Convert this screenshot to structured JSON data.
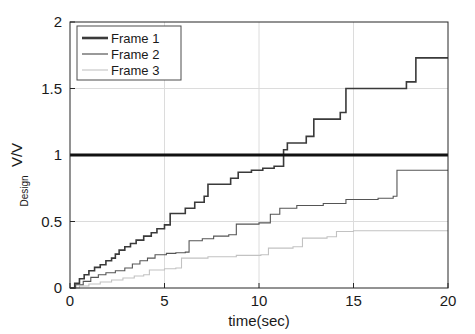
{
  "chart_data": {
    "type": "line",
    "title": "",
    "xlabel": "time(sec)",
    "ylabel": "V/V",
    "ylabel_subscript": "Design",
    "xlim": [
      0,
      20
    ],
    "ylim": [
      0,
      2
    ],
    "xticks": [
      0,
      5,
      10,
      15,
      20
    ],
    "xticklabels": [
      "0",
      "5",
      "10",
      "15",
      "20"
    ],
    "yticks": [
      0,
      0.5,
      1,
      1.5,
      2
    ],
    "yticklabels": [
      "0",
      "0.5",
      "1",
      "1.5",
      "2"
    ],
    "grid": true,
    "legend_position": "upper-left",
    "drawstyle": "steps-post",
    "series": [
      {
        "name": "Frame 1",
        "color": "#3a3a3a",
        "width": 1.6,
        "points": [
          [
            0.0,
            0.0
          ],
          [
            0.25,
            0.035
          ],
          [
            0.5,
            0.07
          ],
          [
            0.75,
            0.1
          ],
          [
            1.0,
            0.13
          ],
          [
            1.3,
            0.155
          ],
          [
            1.6,
            0.175
          ],
          [
            1.9,
            0.205
          ],
          [
            2.2,
            0.225
          ],
          [
            2.4,
            0.255
          ],
          [
            2.6,
            0.285
          ],
          [
            2.9,
            0.31
          ],
          [
            3.2,
            0.335
          ],
          [
            3.5,
            0.36
          ],
          [
            3.9,
            0.39
          ],
          [
            4.3,
            0.415
          ],
          [
            4.6,
            0.445
          ],
          [
            5.0,
            0.475
          ],
          [
            5.3,
            0.56
          ],
          [
            6.1,
            0.6
          ],
          [
            6.6,
            0.645
          ],
          [
            7.1,
            0.69
          ],
          [
            7.3,
            0.78
          ],
          [
            8.5,
            0.825
          ],
          [
            8.9,
            0.87
          ],
          [
            9.6,
            0.885
          ],
          [
            10.2,
            0.9
          ],
          [
            10.8,
            0.915
          ],
          [
            11.3,
            1.04
          ],
          [
            11.5,
            1.09
          ],
          [
            12.5,
            1.14
          ],
          [
            12.9,
            1.27
          ],
          [
            14.3,
            1.32
          ],
          [
            14.6,
            1.5
          ],
          [
            17.8,
            1.55
          ],
          [
            18.3,
            1.73
          ],
          [
            20.0,
            1.73
          ]
        ]
      },
      {
        "name": "Frame 2",
        "color": "#555555",
        "width": 1.1,
        "points": [
          [
            0.0,
            0.0
          ],
          [
            0.3,
            0.025
          ],
          [
            0.7,
            0.05
          ],
          [
            1.1,
            0.08
          ],
          [
            1.5,
            0.1
          ],
          [
            1.9,
            0.115
          ],
          [
            2.4,
            0.13
          ],
          [
            2.9,
            0.15
          ],
          [
            3.3,
            0.18
          ],
          [
            3.7,
            0.205
          ],
          [
            4.1,
            0.225
          ],
          [
            4.5,
            0.25
          ],
          [
            5.1,
            0.26
          ],
          [
            5.6,
            0.265
          ],
          [
            6.1,
            0.27
          ],
          [
            6.3,
            0.355
          ],
          [
            7.0,
            0.37
          ],
          [
            7.6,
            0.39
          ],
          [
            8.4,
            0.4
          ],
          [
            8.8,
            0.48
          ],
          [
            10.0,
            0.49
          ],
          [
            10.6,
            0.555
          ],
          [
            11.1,
            0.6
          ],
          [
            12.0,
            0.62
          ],
          [
            13.4,
            0.635
          ],
          [
            14.6,
            0.665
          ],
          [
            16.3,
            0.675
          ],
          [
            17.1,
            0.69
          ],
          [
            17.3,
            0.885
          ],
          [
            20.0,
            0.885
          ]
        ]
      },
      {
        "name": "Frame 3",
        "color": "#c2c2c2",
        "width": 1.1,
        "points": [
          [
            0.0,
            0.0
          ],
          [
            0.5,
            0.015
          ],
          [
            1.0,
            0.03
          ],
          [
            1.6,
            0.045
          ],
          [
            2.2,
            0.06
          ],
          [
            2.8,
            0.075
          ],
          [
            3.4,
            0.09
          ],
          [
            3.9,
            0.1
          ],
          [
            4.2,
            0.135
          ],
          [
            5.0,
            0.145
          ],
          [
            5.6,
            0.15
          ],
          [
            5.9,
            0.225
          ],
          [
            7.3,
            0.235
          ],
          [
            8.8,
            0.245
          ],
          [
            10.1,
            0.25
          ],
          [
            10.5,
            0.3
          ],
          [
            11.8,
            0.31
          ],
          [
            12.3,
            0.375
          ],
          [
            13.6,
            0.385
          ],
          [
            14.1,
            0.425
          ],
          [
            15.0,
            0.43
          ],
          [
            20.0,
            0.43
          ]
        ]
      }
    ],
    "reference_line": {
      "name": "design-reference",
      "y": 1.0,
      "color": "#111111",
      "width": 3.2
    }
  },
  "legend": {
    "entries": [
      {
        "label": "Frame 1"
      },
      {
        "label": "Frame 2"
      },
      {
        "label": "Frame 3"
      }
    ]
  }
}
